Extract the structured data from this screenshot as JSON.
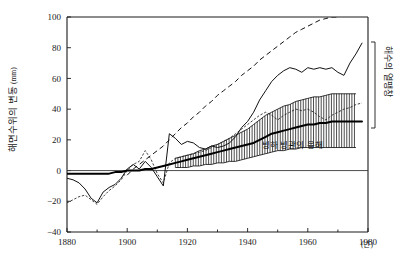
{
  "figure": {
    "kind": "line-chart-with-uncertainty-band",
    "background_color": "#ffffff",
    "ink_color": "#111111"
  },
  "axes": {
    "y_axis_title": "해면수위의 변동",
    "y_axis_unit": "(mm)",
    "x_axis_unit_suffix": "(년)",
    "y_ticks": [
      "100",
      "80",
      "60",
      "40",
      "20",
      "0",
      "-20",
      "-40"
    ],
    "x_ticks": [
      "1880",
      "1900",
      "1920",
      "1940",
      "1960",
      "1980"
    ],
    "x_minor_tick_years": [
      1890,
      1910,
      1930,
      1950,
      1970
    ],
    "grid": "off",
    "zero_line": true
  },
  "annotations": {
    "band_label": "빙하 빙관의 융해",
    "right_bracket_label": "해수의 열팽창"
  },
  "chart_data": {
    "type": "line",
    "title": "",
    "xlabel": "(년)",
    "ylabel": "해면수위의 변동(mm)",
    "xlim": [
      1880,
      1980
    ],
    "ylim": [
      -40,
      100
    ],
    "x": [
      1880,
      1882,
      1884,
      1886,
      1888,
      1890,
      1892,
      1894,
      1896,
      1898,
      1900,
      1902,
      1904,
      1906,
      1908,
      1910,
      1912,
      1914,
      1916,
      1918,
      1920,
      1922,
      1924,
      1926,
      1928,
      1930,
      1932,
      1934,
      1936,
      1938,
      1940,
      1942,
      1944,
      1946,
      1948,
      1950,
      1952,
      1954,
      1956,
      1958,
      1960,
      1962,
      1964,
      1966,
      1968,
      1970,
      1972,
      1974,
      1976,
      1978
    ],
    "series": [
      {
        "name": "observed-sea-level-solid",
        "style": "solid-thin",
        "values": [
          -5,
          -6,
          -8,
          -12,
          -18,
          -21,
          -14,
          -11,
          -9,
          -5,
          1,
          4,
          1,
          6,
          2,
          -4,
          -10,
          24,
          21,
          17,
          19,
          18,
          15,
          14,
          16,
          15,
          16,
          18,
          22,
          28,
          32,
          38,
          46,
          52,
          58,
          62,
          65,
          67,
          66,
          64,
          67,
          66,
          67,
          66,
          67,
          64,
          62,
          70,
          76,
          83
        ]
      },
      {
        "name": "thermal-expansion-dashed",
        "style": "dashed-long",
        "values": [
          null,
          null,
          null,
          null,
          null,
          null,
          null,
          null,
          null,
          null,
          -3,
          1,
          4,
          7,
          10,
          13,
          16,
          20,
          24,
          28,
          31,
          35,
          38,
          42,
          45,
          49,
          52,
          55,
          58,
          62,
          65,
          68,
          72,
          75,
          78,
          81,
          84,
          87,
          90,
          92,
          94,
          96,
          98,
          99,
          100,
          100,
          null,
          null,
          null,
          null
        ]
      },
      {
        "name": "glacier-icecap-melt-center",
        "style": "solid-thick",
        "values": [
          -2,
          -2,
          -2,
          -2,
          -2,
          -2,
          -2,
          -2,
          -1,
          -1,
          0,
          0,
          0,
          1,
          1,
          2,
          3,
          4,
          5,
          6,
          7,
          8,
          9,
          10,
          11,
          12,
          13,
          14,
          15,
          16,
          17,
          18,
          20,
          22,
          24,
          25,
          26,
          27,
          28,
          29,
          30,
          30,
          31,
          31,
          32,
          32,
          32,
          32,
          32,
          32
        ]
      },
      {
        "name": "glacier-band-upper",
        "style": "band-edge",
        "values": [
          null,
          null,
          null,
          null,
          null,
          null,
          null,
          null,
          null,
          null,
          null,
          null,
          null,
          null,
          null,
          null,
          null,
          null,
          8,
          9,
          10,
          11,
          13,
          14,
          16,
          17,
          19,
          21,
          23,
          25,
          27,
          30,
          33,
          36,
          38,
          40,
          42,
          43,
          45,
          46,
          47,
          48,
          48,
          49,
          50,
          50,
          50,
          50,
          50,
          null
        ]
      },
      {
        "name": "glacier-band-lower",
        "style": "band-edge",
        "values": [
          null,
          null,
          null,
          null,
          null,
          null,
          null,
          null,
          null,
          null,
          null,
          null,
          null,
          null,
          null,
          null,
          null,
          null,
          2,
          2,
          2,
          3,
          3,
          4,
          4,
          5,
          5,
          6,
          6,
          7,
          8,
          9,
          10,
          11,
          12,
          13,
          13,
          14,
          14,
          15,
          15,
          15,
          15,
          15,
          15,
          15,
          15,
          15,
          15,
          null
        ]
      },
      {
        "name": "combined-estimate-dotted",
        "style": "dotted",
        "values": [
          -21,
          -19,
          -17,
          -16,
          -19,
          -22,
          -17,
          -13,
          -10,
          -6,
          0,
          4,
          6,
          13,
          7,
          -2,
          -8,
          5,
          8,
          9,
          10,
          11,
          12,
          13,
          15,
          17,
          19,
          21,
          24,
          27,
          30,
          33,
          36,
          38,
          36,
          33,
          36,
          38,
          40,
          39,
          40,
          38,
          35,
          33,
          36,
          38,
          40,
          41,
          43,
          44
        ]
      }
    ],
    "legend": "inline-annotations",
    "legend_position": "in-plot-and-right-margin"
  }
}
